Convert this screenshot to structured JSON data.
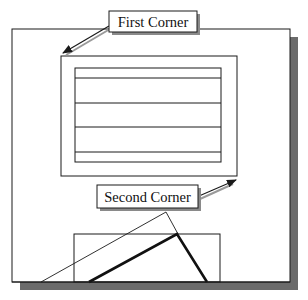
{
  "diagram": {
    "callouts": {
      "first_corner": {
        "label": "First Corner"
      },
      "second_corner": {
        "label": "Second Corner"
      }
    },
    "colors": {
      "background": "#ffffff",
      "line": "#1a1a1a",
      "shadow": "#6b6b6b",
      "label_shadow": "#8a8a8a"
    },
    "shapes": {
      "viewport_frame": {
        "x": 12,
        "y": 29,
        "width": 278,
        "height": 253
      },
      "selection_window": {
        "x": 61,
        "y": 56,
        "width": 176,
        "height": 120
      },
      "table_block": {
        "x": 75,
        "y": 68,
        "width": 146,
        "height": 94,
        "row_lines_y": [
          78,
          103,
          127,
          152
        ]
      },
      "lower_rectangle": {
        "x": 74,
        "y": 234,
        "width": 146,
        "height": 48
      },
      "thin_triangle": {
        "points": "41,282 166,212 178,234"
      },
      "thick_polyline": {
        "points": "89,282 177,234 207,282"
      }
    }
  }
}
